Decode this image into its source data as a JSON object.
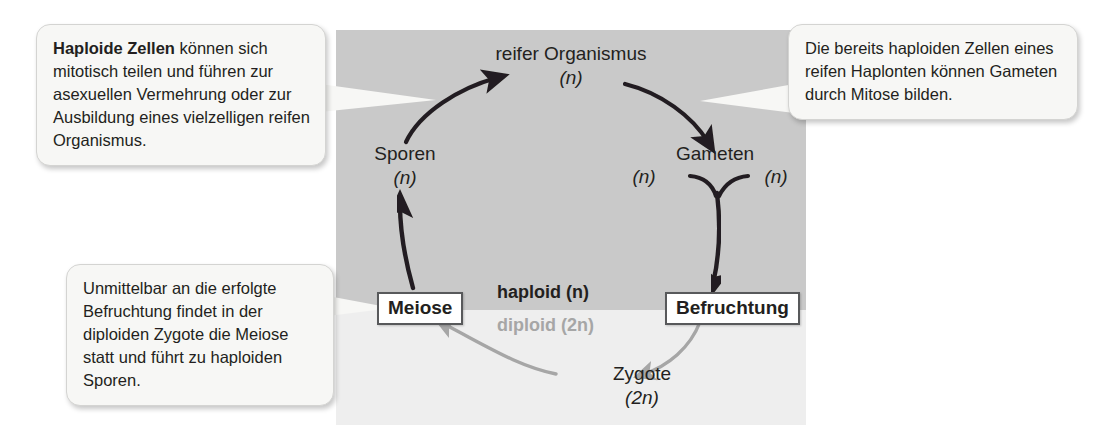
{
  "diagram": {
    "panels": {
      "haploid_zone_color": "#c9c9c9",
      "diploid_zone_color": "#eeeeee"
    },
    "zone_labels": {
      "haploid": "haploid (n)",
      "diploid": "diploid (2n)"
    },
    "nodes": {
      "reifer_organismus": {
        "name": "reifer Organismus",
        "ploidy": "(n)"
      },
      "sporen": {
        "name": "Sporen",
        "ploidy": "(n)"
      },
      "gameten": {
        "name": "Gameten",
        "ploidy_left": "(n)",
        "ploidy_right": "(n)"
      },
      "zygote": {
        "name": "Zygote",
        "ploidy": "(2n)"
      }
    },
    "processes": {
      "meiose": "Meiose",
      "befruchtung": "Befruchtung"
    },
    "callouts": [
      {
        "id": "haploide-zellen",
        "bold_lead": "Haploide Zellen",
        "text": " können sich mitotisch teilen und führen zur asexuellen Vermehrung oder zur Ausbildung eines vielzelligen reifen Organismus."
      },
      {
        "id": "bereits-haploide-zellen",
        "bold_lead": "",
        "text": "Die bereits haploiden Zellen eines reifen Haplonten können Gameten durch Mitose bilden."
      },
      {
        "id": "befruchtung-meiose",
        "bold_lead": "",
        "text": "Unmittelbar an die erfolgte Befruchtung findet in der diploiden Zygote die Meiose statt und führt zu haploiden Sporen."
      }
    ],
    "arrow_colors": {
      "haploid_arrow": "#231f20",
      "diploid_arrow": "#a6a6a6"
    }
  }
}
